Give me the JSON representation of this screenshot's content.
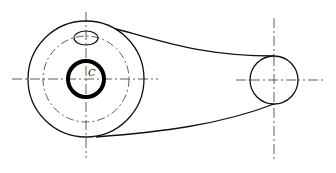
{
  "diagram": {
    "type": "mechanical-drawing",
    "colors": {
      "line": "#111111",
      "background": "#ffffff"
    },
    "labels": [
      {
        "id": "center-label",
        "text": "C"
      }
    ],
    "elements": {
      "large_boss": {
        "cx": 86,
        "cy": 79,
        "outer_r": 58,
        "pitch_r": 43,
        "hole_r": 18
      },
      "oil_hole": {
        "cx": 86,
        "cy": 38,
        "rx": 12,
        "ry": 7
      },
      "small_boss": {
        "cx": 274,
        "cy": 80,
        "r": 24
      }
    }
  }
}
